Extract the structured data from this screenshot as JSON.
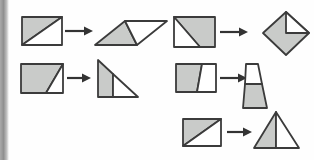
{
  "canvas": {
    "width": 314,
    "height": 160,
    "background": "#fefefe"
  },
  "colors": {
    "shape_fill_shaded": "#c9cbc9",
    "shape_fill_unshaded": "#ffffff",
    "shape_stroke": "#3b3b3b",
    "arrow_color": "#333333",
    "page_edge_gradient": [
      "#aaaaaa",
      "#8f8f8f",
      "#c2c2c2",
      "#ffffff"
    ]
  },
  "diagram": {
    "pairs": [
      {
        "id": "pair-1",
        "source_shape": "rectangle-diagonal-shaded-upper-left",
        "target_shape": "parallelogram-left-triangle-shaded",
        "source_polygons": [
          {
            "fill": "shaded",
            "points": [
              [
                22,
                45
              ],
              [
                22,
                17
              ],
              [
                62,
                17
              ]
            ]
          },
          {
            "fill": "unshaded",
            "points": [
              [
                22,
                45
              ],
              [
                62,
                45
              ],
              [
                62,
                17
              ]
            ]
          }
        ],
        "arrow": {
          "x1": 65,
          "x2": 93,
          "y": 31
        },
        "target_polygons": [
          {
            "fill": "shaded",
            "points": [
              [
                95,
                45
              ],
              [
                137,
                45
              ],
              [
                125,
                21
              ]
            ]
          },
          {
            "fill": "unshaded",
            "points": [
              [
                137,
                45
              ],
              [
                167,
                21
              ],
              [
                125,
                21
              ]
            ]
          }
        ]
      },
      {
        "id": "pair-2",
        "source_shape": "rectangle-diagonal-white-lower-left-triangle",
        "target_shape": "diamond-white-upper-right-quadrant",
        "source_polygons": [
          {
            "fill": "shaded",
            "points": [
              [
                174,
                17
              ],
              [
                215,
                17
              ],
              [
                215,
                47
              ],
              [
                200,
                47
              ]
            ]
          },
          {
            "fill": "unshaded",
            "points": [
              [
                174,
                17
              ],
              [
                200,
                47
              ],
              [
                174,
                47
              ]
            ]
          }
        ],
        "arrow": {
          "x1": 220,
          "x2": 248,
          "y": 32
        },
        "target_polygons": [
          {
            "fill": "shaded",
            "points": [
              [
                286,
                12
              ],
              [
                309,
                33
              ],
              [
                286,
                55
              ],
              [
                263,
                33
              ]
            ]
          },
          {
            "fill": "unshaded",
            "points": [
              [
                286,
                12
              ],
              [
                309,
                33
              ],
              [
                286,
                33
              ]
            ]
          }
        ]
      },
      {
        "id": "pair-3",
        "source_shape": "rectangle-white-lower-right-corner-triangle",
        "target_shape": "right-triangle-vertical-split-left-shaded",
        "source_polygons": [
          {
            "fill": "shaded",
            "points": [
              [
                21,
                64
              ],
              [
                63,
                64
              ],
              [
                46,
                93
              ],
              [
                21,
                93
              ]
            ]
          },
          {
            "fill": "unshaded",
            "points": [
              [
                46,
                93
              ],
              [
                63,
                93
              ],
              [
                63,
                64
              ]
            ]
          }
        ],
        "arrow": {
          "x1": 67,
          "x2": 91,
          "y": 78
        },
        "target_polygons": [
          {
            "fill": "shaded",
            "points": [
              [
                98,
                60
              ],
              [
                98,
                97
              ],
              [
                113,
                97
              ],
              [
                113,
                74
              ]
            ]
          },
          {
            "fill": "unshaded",
            "points": [
              [
                113,
                97
              ],
              [
                138,
                97
              ],
              [
                113,
                74
              ]
            ]
          }
        ]
      },
      {
        "id": "pair-4",
        "source_shape": "rectangle-slanted-split-left-shaded",
        "target_shape": "tall-trapezoid-bottom-shaded",
        "source_polygons": [
          {
            "fill": "shaded",
            "points": [
              [
                176,
                64
              ],
              [
                202,
                64
              ],
              [
                197,
                92
              ],
              [
                176,
                92
              ]
            ]
          },
          {
            "fill": "unshaded",
            "points": [
              [
                202,
                64
              ],
              [
                216,
                64
              ],
              [
                216,
                92
              ],
              [
                197,
                92
              ]
            ]
          }
        ],
        "arrow": {
          "x1": 220,
          "x2": 247,
          "y": 78
        },
        "target_polygons": [
          {
            "fill": "unshaded",
            "points": [
              [
                246,
                64
              ],
              [
                258,
                64
              ],
              [
                262,
                84
              ],
              [
                245,
                84
              ]
            ]
          },
          {
            "fill": "shaded",
            "points": [
              [
                245,
                84
              ],
              [
                262,
                84
              ],
              [
                267,
                108
              ],
              [
                243,
                108
              ]
            ]
          }
        ]
      },
      {
        "id": "pair-5",
        "source_shape": "rectangle-diagonal-shaded-upper-left",
        "target_shape": "isosceles-triangle-vertical-split-left-shaded",
        "source_polygons": [
          {
            "fill": "shaded",
            "points": [
              [
                183,
                146
              ],
              [
                183,
                119
              ],
              [
                221,
                119
              ]
            ]
          },
          {
            "fill": "unshaded",
            "points": [
              [
                183,
                146
              ],
              [
                221,
                146
              ],
              [
                221,
                119
              ]
            ]
          }
        ],
        "arrow": {
          "x1": 227,
          "x2": 252,
          "y": 132
        },
        "target_polygons": [
          {
            "fill": "shaded",
            "points": [
              [
                276,
                112
              ],
              [
                254,
                148
              ],
              [
                276,
                148
              ]
            ]
          },
          {
            "fill": "unshaded",
            "points": [
              [
                276,
                112
              ],
              [
                276,
                148
              ],
              [
                299,
                148
              ]
            ]
          }
        ]
      }
    ]
  }
}
